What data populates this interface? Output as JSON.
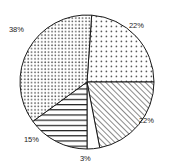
{
  "chart_data": {
    "type": "pie",
    "title": "",
    "subtitle": "",
    "xlabel": "",
    "ylabel": "",
    "grid": false,
    "legend": "none",
    "label_format": "percent",
    "categories": [
      "22%",
      "22%",
      "3%",
      "15%",
      "38%"
    ],
    "values": [
      22,
      22,
      3,
      15,
      38
    ],
    "slices": [
      {
        "label": "22%",
        "value": 22,
        "pattern": "dots-sparse",
        "fill": "#ffffff",
        "stroke": "#1a1a1a",
        "start_angle": 4,
        "end_angle": 90,
        "label_position": "top-right"
      },
      {
        "label": "22%",
        "value": 22,
        "pattern": "diagonal-hatch",
        "fill": "#ffffff",
        "stroke": "#1a1a1a",
        "start_angle": 90,
        "end_angle": 169,
        "label_position": "right-bottom"
      },
      {
        "label": "3%",
        "value": 3,
        "pattern": "solid-white",
        "fill": "#ffffff",
        "stroke": "#1a1a1a",
        "start_angle": 169,
        "end_angle": 180,
        "label_position": "bottom"
      },
      {
        "label": "15%",
        "value": 15,
        "pattern": "horizontal-lines",
        "fill": "#ffffff",
        "stroke": "#1a1a1a",
        "start_angle": 180,
        "end_angle": 234,
        "label_position": "bottom-left"
      },
      {
        "label": "38%",
        "value": 38,
        "pattern": "dots-dense",
        "fill": "#ffffff",
        "stroke": "#1a1a1a",
        "start_angle": 234,
        "end_angle": 364,
        "label_position": "top-left"
      }
    ],
    "total": 100,
    "geometry": {
      "center_x": 87,
      "center_y": 82,
      "radius": 67
    },
    "colors": {
      "background": "#ffffff",
      "outline": "#1a1a1a",
      "label_text": "#1a1a1a",
      "pattern_ink": "#4d4d4d"
    }
  }
}
